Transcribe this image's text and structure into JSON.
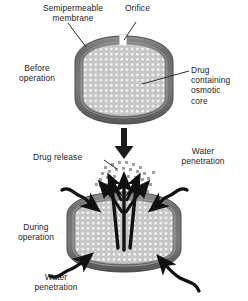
{
  "figure": {
    "width": 248,
    "height": 301,
    "background": "#ffffff"
  },
  "labels": {
    "semipermeable_membrane": "Semipermeable\nmembrane",
    "orifice": "Orifice",
    "before_operation": "Before\noperation",
    "drug_containing_osmotic_core": "Drug\ncontaining\nosmotic\ncore",
    "drug_release": "Drug release",
    "water_penetration_top": "Water\npenetration",
    "during_operation": "During\noperation",
    "water_penetration_bottom": "Water\npenetration"
  },
  "colors": {
    "text": "#1c1c1c",
    "background": "#ffffff",
    "membrane_outer": "#6f6f6f",
    "membrane_shadow": "#575757",
    "membrane_highlight": "#9a9a9a",
    "core_fill": "#c9c9c9",
    "core_stipple": "#ffffff",
    "leader_line": "#2b2b2b",
    "arrow_black": "#111111",
    "drug_particle": "#9e9e9e",
    "orifice_fill": "#ffffff"
  },
  "panels": [
    {
      "id": "before",
      "state_label": "Before\noperation",
      "capsule": {
        "cx": 124,
        "cy": 80,
        "rx": 49,
        "ry": 44
      },
      "features": [
        "semipermeable membrane",
        "orifice",
        "drug containing osmotic core"
      ]
    },
    {
      "id": "during",
      "state_label": "During\noperation",
      "capsule": {
        "cx": 124,
        "cy": 232,
        "rx": 57,
        "ry": 41
      },
      "features": [
        "drug release",
        "water penetration x4"
      ]
    }
  ],
  "annotations": {
    "transition_arrow": "downward-arrow",
    "water_penetration_arrow_count": 4,
    "drug_release_arrow_count": 6
  }
}
